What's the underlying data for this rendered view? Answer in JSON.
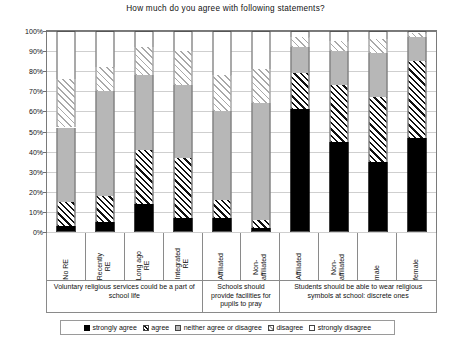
{
  "chart_data": {
    "type": "bar",
    "title": "How much do you agree with following statements?",
    "xlabel": "",
    "ylabel": "",
    "ylim": [
      0,
      100
    ],
    "grid": true,
    "stacked": true,
    "stack_mode": "percent",
    "legend_position": "bottom",
    "categories": [
      "No RE",
      "Recently\nRE",
      "Long ago\nRE",
      "Integrated\nRE",
      "Affiliated",
      "Non-\naffiliated",
      "Affiliated",
      "Non-\naffiliated",
      "male",
      "female"
    ],
    "groups": [
      {
        "label": "Voluntary religious services could be a part of school life",
        "span": 4
      },
      {
        "label": "Schools should provide facilities for pupils to pray",
        "span": 2
      },
      {
        "label": "Students should be able to wear religious symbols at school: discrete ones",
        "span": 4
      }
    ],
    "series": [
      {
        "name": "strongly agree",
        "key": "s0",
        "color": "#000000",
        "pattern": "solid",
        "values": [
          3,
          5,
          14,
          7,
          7,
          2,
          61,
          45,
          35,
          47
        ]
      },
      {
        "name": "agree",
        "key": "s1",
        "color": "#111111",
        "pattern": "hatch-dark",
        "values": [
          12,
          13,
          27,
          30,
          9,
          4,
          18,
          28,
          32,
          38
        ]
      },
      {
        "name": "neither agree or disagree",
        "key": "s2",
        "color": "#b7b7b7",
        "pattern": "solid",
        "values": [
          37,
          52,
          37,
          36,
          44,
          58,
          13,
          17,
          22,
          12
        ]
      },
      {
        "name": "disagree",
        "key": "s3",
        "color": "#a9a9a9",
        "pattern": "hatch-light",
        "values": [
          24,
          12,
          14,
          17,
          18,
          17,
          5,
          5,
          7,
          2
        ]
      },
      {
        "name": "strongly disagree",
        "key": "s4",
        "color": "#ffffff",
        "pattern": "solid",
        "values": [
          24,
          18,
          8,
          10,
          22,
          19,
          3,
          5,
          4,
          1
        ]
      }
    ],
    "yticks": [
      "0%",
      "10%",
      "20%",
      "30%",
      "40%",
      "50%",
      "60%",
      "70%",
      "80%",
      "90%",
      "100%"
    ],
    "ytick_values": [
      0,
      10,
      20,
      30,
      40,
      50,
      60,
      70,
      80,
      90,
      100
    ]
  }
}
